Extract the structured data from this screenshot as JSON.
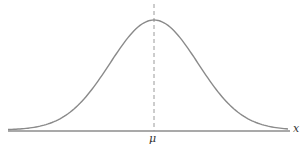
{
  "diagram": {
    "mean_label": "μ",
    "axis_label": "x",
    "colors": {
      "curve": "#8a8a8a",
      "axis": "#555555",
      "mean_line": "#9a9a9a"
    }
  }
}
